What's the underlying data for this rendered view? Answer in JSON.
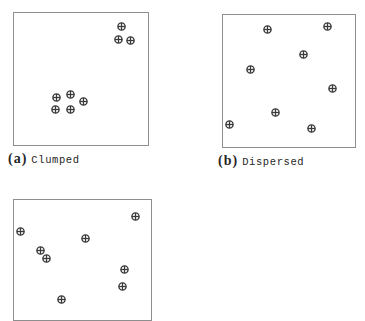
{
  "figure": {
    "title_strip": "",
    "marker_icon": "circle-plus-icon",
    "marker_color": "#3a3a3a",
    "panel_border_color": "#8e8e8e",
    "background_color": "#ffffff"
  },
  "panels": [
    {
      "id": "a",
      "index_label": "(a)",
      "caption": "Clumped",
      "caption_visible": true,
      "point_count": 8,
      "description": "Individuals aggregated into two tight clusters"
    },
    {
      "id": "b",
      "index_label": "(b)",
      "caption": "Dispersed",
      "caption_visible": true,
      "point_count": 8,
      "description": "Individuals evenly spaced apart"
    },
    {
      "id": "c",
      "index_label": "",
      "caption": "",
      "caption_visible": false,
      "point_count": 8,
      "description": "Individuals scattered at random; panel cropped at image bottom"
    }
  ],
  "chart_data": {
    "type": "scatter",
    "title": "",
    "xlabel": "",
    "ylabel": "",
    "xlim": [
      0,
      100
    ],
    "ylim": [
      0,
      100
    ],
    "grid": false,
    "legend": null,
    "marker": "circle-plus",
    "panels": [
      {
        "name": "(a) Clumped",
        "points": [
          [
            80,
            90
          ],
          [
            78,
            80
          ],
          [
            87,
            79
          ],
          [
            32,
            36
          ],
          [
            42,
            38
          ],
          [
            52,
            33
          ],
          [
            31,
            27
          ],
          [
            42,
            27
          ]
        ]
      },
      {
        "name": "(b) Dispersed",
        "points": [
          [
            34,
            89
          ],
          [
            79,
            91
          ],
          [
            61,
            70
          ],
          [
            21,
            59
          ],
          [
            83,
            44
          ],
          [
            40,
            26
          ],
          [
            5,
            17
          ],
          [
            67,
            14
          ]
        ]
      },
      {
        "name": "(c) Random",
        "points": [
          [
            89,
            86
          ],
          [
            5,
            74
          ],
          [
            52,
            68
          ],
          [
            19,
            58
          ],
          [
            24,
            51
          ],
          [
            81,
            42
          ],
          [
            79,
            28
          ],
          [
            35,
            17
          ]
        ]
      }
    ]
  }
}
